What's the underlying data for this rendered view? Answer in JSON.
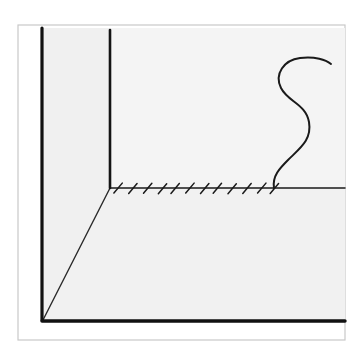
{
  "artwork": {
    "title": "Room Corner with Hatched Ground Line and S-Curve",
    "medium": "pen line drawing",
    "background_color": "#ffffff",
    "ink_color": "#1a1a1a",
    "panel_fill": "#f2f2f2",
    "thin_frame_color": "#c8c8c8",
    "canvas_width": 364,
    "canvas_height": 364
  },
  "frame": {
    "name": "outer-thin-frame",
    "x": 18,
    "y": 25,
    "width": 327,
    "height": 315,
    "stroke": "#c9c9c9",
    "stroke_width": 1.2,
    "fill": "none"
  },
  "panels": [
    {
      "name": "left-wall-panel",
      "points": "42,28 110,28 110,188 42,320",
      "fill": "#f0f0f0"
    },
    {
      "name": "back-wall-panel",
      "points": "110,28 345,28 345,188 110,188",
      "fill": "#f4f4f4"
    },
    {
      "name": "floor-panel",
      "points": "42,320 110,188 345,188 345,322",
      "fill": "#f1f1f1"
    }
  ],
  "strokes": {
    "left_vertical": {
      "name": "left-wall-vertical-edge",
      "x1": 42,
      "y1": 28,
      "x2": 42,
      "y2": 320,
      "width": 3.2
    },
    "corner_vertical": {
      "name": "corner-vertical-edge",
      "x1": 110,
      "y1": 30,
      "x2": 110,
      "y2": 188,
      "width": 2.6
    },
    "bottom_horizontal": {
      "name": "bottom-edge",
      "x1": 42,
      "y1": 321,
      "x2": 345,
      "y2": 321,
      "width": 3.4
    },
    "ground_horizontal": {
      "name": "ground-line",
      "x1": 110,
      "y1": 188,
      "x2": 345,
      "y2": 188,
      "width": 1.5
    },
    "diagonal": {
      "name": "floor-diagonal-edge",
      "x1": 43,
      "y1": 320,
      "x2": 110,
      "y2": 188,
      "width": 1.4
    }
  },
  "hatching": {
    "name": "ground-hatch-marks",
    "count": 12,
    "start_x": 116,
    "end_x": 272,
    "baseline_y": 188,
    "mark_length": 13,
    "mark_angle_deg": 50,
    "stroke_width": 1.5
  },
  "s_curve": {
    "name": "s-curve-squiggle",
    "stroke_width": 2.0,
    "base_point": [
      274,
      188
    ],
    "top_tip": [
      331,
      62
    ],
    "path": "M274,188 C272,176 280,168 288,160 C300,148 312,140 309,122 C306,104 288,102 281,88 C274,74 284,60 300,58 C315,56 326,60 331,64"
  },
  "tones": {
    "paper": "#ffffff",
    "wall_light": "#f4f4f4",
    "wall_shade": "#eeeeee",
    "floor": "#f1f1f1"
  }
}
